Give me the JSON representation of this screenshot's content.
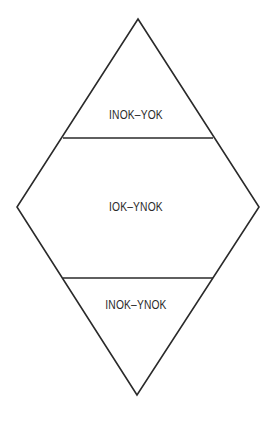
{
  "diagram": {
    "shape": "diamond divided into three horizontal sections",
    "sections": [
      {
        "position": "top",
        "label": "INOK–YOK"
      },
      {
        "position": "middle",
        "label": "IOK–YNOK"
      },
      {
        "position": "bottom",
        "label": "INOK–YNOK"
      }
    ],
    "colors": {
      "stroke": "#2a2a2a",
      "background": "#ffffff",
      "text": "#2a2a2a"
    }
  }
}
